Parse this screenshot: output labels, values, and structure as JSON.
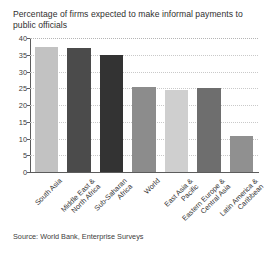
{
  "chart_data": {
    "type": "bar",
    "title": "Percentage of firms expected to make informal payments to public officials",
    "xlabel": "",
    "ylabel": "",
    "ylim": [
      0,
      40
    ],
    "yticks": [
      0,
      5,
      10,
      15,
      20,
      25,
      30,
      35,
      40
    ],
    "grid": true,
    "legend": false,
    "source": "Source: World Bank, Enterprise Surveys",
    "categories": [
      "South Asia",
      "Middle East &\nNorth Africa",
      "Sub-Saharan\nAfrica",
      "World",
      "East Asia &\nPacific",
      "Eastern Europe &\nCentral Asia",
      "Latin America &\nCaribbean"
    ],
    "values": [
      37.3,
      37.0,
      35.0,
      25.5,
      24.5,
      25.0,
      10.7
    ],
    "bar_colors": [
      "#c2c2c2",
      "#4b4b4b",
      "#333333",
      "#8c8c8c",
      "#cfcfcf",
      "#6e6e6e",
      "#909090"
    ]
  },
  "axis": {
    "tick_labels": [
      "0",
      "5",
      "10",
      "15",
      "20",
      "25",
      "30",
      "35",
      "40"
    ]
  },
  "colors": {
    "background": "#ffffff",
    "axis": "#5c5c5c",
    "grid": "#c9c9c9",
    "text": "#2f2f2f"
  }
}
